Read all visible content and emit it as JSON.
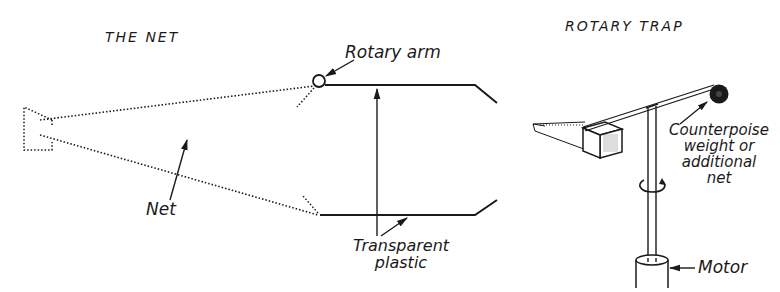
{
  "panels": {
    "net": {
      "title": "THE NET",
      "labels": {
        "rotary_arm": "Rotary arm",
        "net": "Net",
        "transparent_plastic_line1": "Transparent",
        "transparent_plastic_line2": "plastic"
      }
    },
    "rotary_trap": {
      "title": "ROTARY TRAP",
      "labels": {
        "counterpoise_line1": "Counterpoise",
        "counterpoise_line2": "weight or",
        "counterpoise_line3": "additional",
        "counterpoise_line4": "net",
        "motor": "Motor"
      }
    }
  },
  "colors": {
    "ink": "#1a1a1a",
    "background": "#ffffff"
  }
}
